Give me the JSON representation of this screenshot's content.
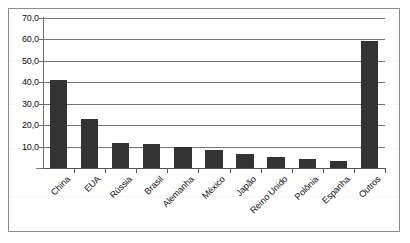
{
  "chart_data": {
    "type": "bar",
    "title": "",
    "subtitle": "",
    "xlabel": "",
    "ylabel": "",
    "categories": [
      "China",
      "EUA",
      "Rússia",
      "Brasil",
      "Alemanha",
      "México",
      "Japão",
      "Reino Unido",
      "Polônia",
      "Espanha",
      "Outros"
    ],
    "values": [
      41.0,
      23.0,
      11.5,
      11.0,
      10.0,
      8.5,
      6.5,
      5.0,
      4.0,
      3.5,
      59.5
    ],
    "ylim": [
      0,
      70
    ],
    "ytick_values": [
      0,
      10,
      20,
      30,
      40,
      50,
      60,
      70
    ],
    "ytick_labels": [
      "-",
      "10,0",
      "20,0",
      "30,0",
      "40,0",
      "50,0",
      "60,0",
      "70,0"
    ],
    "grid": "horizontal",
    "legend": "none",
    "bar_color": "#333333",
    "gridline_color": "#777777",
    "axis_color": "#6e6e6e",
    "background_color": "#ffffff",
    "xlabel_rotation_deg": -45,
    "decimal_separator": ","
  }
}
